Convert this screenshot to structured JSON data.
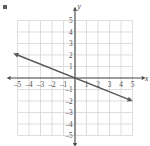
{
  "figure": {
    "axis_labels": {
      "x": "x",
      "y": "y"
    },
    "corner_mark": "bullet-mark"
  },
  "chart_data": {
    "type": "line",
    "title": "",
    "xlabel": "x",
    "ylabel": "y",
    "xlim": [
      -5.5,
      5.5
    ],
    "ylim": [
      -5.5,
      5.5
    ],
    "grid": true,
    "grid_spacing": 1,
    "legend": "none",
    "x_ticks": [
      -5,
      -4,
      -3,
      -2,
      -1,
      1,
      2,
      3,
      4,
      5
    ],
    "y_ticks": [
      -5,
      -4,
      -3,
      -2,
      -1,
      1,
      2,
      3,
      4,
      5
    ],
    "x_tick_labels": [
      "–5",
      "–4",
      "–3",
      "–2",
      "–1",
      "1",
      "2",
      "3",
      "4",
      "5"
    ],
    "y_tick_labels": [
      "–5",
      "–4",
      "–3",
      "–2",
      "–1",
      "1",
      "2",
      "3",
      "4",
      "5"
    ],
    "series": [
      {
        "name": "line",
        "equation": "y = -2/5 x",
        "slope": -0.4,
        "intercept": 0,
        "arrows": "both",
        "color": "#5a5a5a",
        "points": [
          {
            "x": -5,
            "y": 2
          },
          {
            "x": 0,
            "y": 0
          },
          {
            "x": 5,
            "y": -2
          }
        ]
      }
    ],
    "colors": {
      "grid": "#d8d8dc",
      "axis": "#4a4a4a",
      "line": "#5a5a5a",
      "text": "#4a4a4a",
      "background": "#ffffff"
    }
  }
}
